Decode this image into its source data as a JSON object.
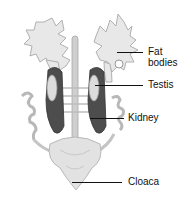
{
  "diagram": {
    "labels": [
      {
        "id": "fat-bodies",
        "line1": "Fat",
        "line2": "bodies"
      },
      {
        "id": "testis",
        "text": "Testis"
      },
      {
        "id": "kidney",
        "text": "Kidney"
      },
      {
        "id": "cloaca",
        "text": "Cloaca"
      }
    ],
    "colors": {
      "fat_body": "#e6e6e6",
      "fat_body_outline": "#b5b5b5",
      "testis": "#d9d9d9",
      "kidney": "#4a4a4a",
      "cloaca": "#e0e0e0",
      "vessel": "#bdbdbd"
    }
  }
}
